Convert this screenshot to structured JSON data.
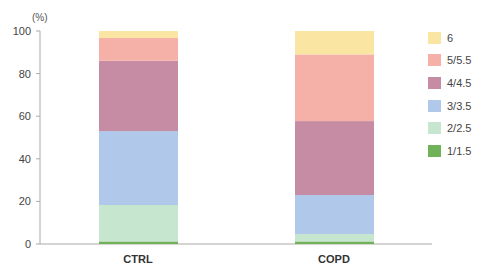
{
  "chart_data": {
    "type": "bar",
    "stacked": true,
    "title": "",
    "xlabel": "",
    "ylabel": "(%)",
    "ylim": [
      0,
      100
    ],
    "yticks": [
      0,
      20,
      40,
      60,
      80,
      100
    ],
    "grid": false,
    "legend_position": "right",
    "categories": [
      "CTRL",
      "COPD"
    ],
    "series": [
      {
        "name": "1/1.5",
        "color": "#6fb25a",
        "values": [
          1.2,
          1.2
        ]
      },
      {
        "name": "2/2.5",
        "color": "#c6e6cf",
        "values": [
          17.1,
          3.5
        ]
      },
      {
        "name": "3/3.5",
        "color": "#b0c8ea",
        "values": [
          34.7,
          18.3
        ]
      },
      {
        "name": "4/4.5",
        "color": "#c58ca3",
        "values": [
          33.0,
          34.7
        ]
      },
      {
        "name": "5/5.5",
        "color": "#f5b0a8",
        "values": [
          10.7,
          31.3
        ]
      },
      {
        "name": "6",
        "color": "#fbe5a3",
        "values": [
          3.3,
          11.0
        ]
      }
    ]
  },
  "axis": {
    "unit": "(%)",
    "ticks": [
      "0",
      "20",
      "40",
      "60",
      "80",
      "100"
    ]
  },
  "legend": [
    {
      "label": "6",
      "color": "#fbe5a3"
    },
    {
      "label": "5/5.5",
      "color": "#f5b0a8"
    },
    {
      "label": "4/4.5",
      "color": "#c58ca3"
    },
    {
      "label": "3/3.5",
      "color": "#b0c8ea"
    },
    {
      "label": "2/2.5",
      "color": "#c6e6cf"
    },
    {
      "label": "1/1.5",
      "color": "#6fb25a"
    }
  ]
}
